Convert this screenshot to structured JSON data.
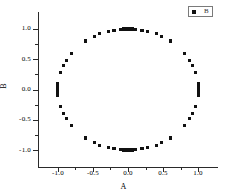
{
  "chart_data": {
    "type": "scatter",
    "title": "",
    "xlabel": "A",
    "ylabel": "B",
    "xlim": [
      -1.28,
      -1.28
    ],
    "ylim": [
      -1.28,
      1.28
    ],
    "grid": false,
    "legend_position": "top-right",
    "series": [
      {
        "name": "B",
        "marker": "square",
        "color": "#111111",
        "points": [
          [
            0.0,
            1.0
          ],
          [
            0.0,
            1.0
          ],
          [
            0.0,
            1.0
          ],
          [
            0.0,
            1.0
          ],
          [
            0.0,
            1.0
          ],
          [
            0.03,
            1.0
          ],
          [
            -0.03,
            1.0
          ],
          [
            0.06,
            1.0
          ],
          [
            -0.06,
            1.0
          ],
          [
            0.1,
            0.995
          ],
          [
            -0.1,
            0.995
          ],
          [
            0.2,
            0.98
          ],
          [
            -0.2,
            0.98
          ],
          [
            0.28,
            0.96
          ],
          [
            -0.28,
            0.96
          ],
          [
            0.4,
            0.92
          ],
          [
            -0.4,
            0.92
          ],
          [
            0.48,
            0.88
          ],
          [
            -0.48,
            0.88
          ],
          [
            0.6,
            0.8
          ],
          [
            -0.6,
            0.8
          ],
          [
            0.8,
            0.6
          ],
          [
            -0.8,
            0.6
          ],
          [
            0.88,
            0.48
          ],
          [
            -0.88,
            0.48
          ],
          [
            0.92,
            0.4
          ],
          [
            -0.92,
            0.4
          ],
          [
            0.96,
            0.28
          ],
          [
            -0.96,
            0.28
          ],
          [
            1.0,
            0.1
          ],
          [
            -1.0,
            0.1
          ],
          [
            1.0,
            0.06
          ],
          [
            -1.0,
            0.06
          ],
          [
            1.0,
            0.03
          ],
          [
            -1.0,
            0.03
          ],
          [
            1.0,
            0.0
          ],
          [
            -1.0,
            0.0
          ],
          [
            1.0,
            -0.03
          ],
          [
            -1.0,
            -0.03
          ],
          [
            1.0,
            -0.06
          ],
          [
            -1.0,
            -0.06
          ],
          [
            1.0,
            -0.1
          ],
          [
            -1.0,
            -0.1
          ],
          [
            0.96,
            -0.28
          ],
          [
            -0.96,
            -0.28
          ],
          [
            0.92,
            -0.4
          ],
          [
            -0.92,
            -0.4
          ],
          [
            0.88,
            -0.48
          ],
          [
            -0.88,
            -0.48
          ],
          [
            0.8,
            -0.6
          ],
          [
            -0.8,
            -0.6
          ],
          [
            0.6,
            -0.8
          ],
          [
            -0.6,
            -0.8
          ],
          [
            0.48,
            -0.88
          ],
          [
            -0.48,
            -0.88
          ],
          [
            0.4,
            -0.92
          ],
          [
            -0.4,
            -0.92
          ],
          [
            0.28,
            -0.96
          ],
          [
            -0.28,
            -0.96
          ],
          [
            0.2,
            -0.98
          ],
          [
            -0.2,
            -0.98
          ],
          [
            0.1,
            -0.995
          ],
          [
            -0.1,
            -0.995
          ],
          [
            0.06,
            -1.0
          ],
          [
            -0.06,
            -1.0
          ],
          [
            0.03,
            -1.0
          ],
          [
            -0.03,
            -1.0
          ],
          [
            0.0,
            -1.0
          ],
          [
            0.0,
            -1.0
          ],
          [
            0.0,
            -1.0
          ]
        ]
      }
    ],
    "x_ticks": [
      {
        "value": -1.0,
        "label": "-1.0"
      },
      {
        "value": -0.5,
        "label": "-0.5"
      },
      {
        "value": 0.0,
        "label": "0.0"
      },
      {
        "value": 0.5,
        "label": "0.5"
      },
      {
        "value": 1.0,
        "label": "1.0"
      }
    ],
    "x_minor_ticks": [
      -0.75,
      -0.25,
      0.25,
      0.75
    ],
    "y_ticks": [
      {
        "value": 1.0,
        "label": "1.0"
      },
      {
        "value": 0.5,
        "label": "0.5"
      },
      {
        "value": 0.0,
        "label": "0.0"
      },
      {
        "value": -0.5,
        "label": "-0.5"
      },
      {
        "value": -1.0,
        "label": "-1.0"
      }
    ],
    "y_minor_ticks": [
      0.75,
      0.25,
      -0.25,
      -0.75
    ]
  },
  "legend": {
    "label": "B"
  },
  "axes": {
    "x_title": "A",
    "y_title": "B"
  }
}
